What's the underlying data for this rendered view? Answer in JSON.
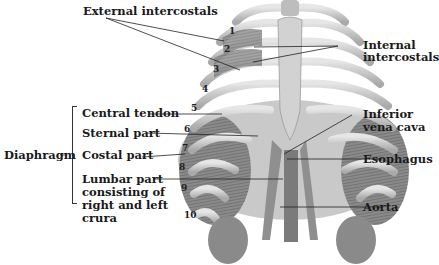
{
  "figure": {
    "labels": {
      "external_intercostals": "External intercostals",
      "internal_intercostals_1": "Internal",
      "internal_intercostals_2": "intercostals",
      "central_tendon": "Central tendon",
      "sternal_part": "Sternal part",
      "costal_part": "Costal part",
      "lumbar_1": "Lumbar part",
      "lumbar_2": "consisting of",
      "lumbar_3": "right and left",
      "lumbar_4": "crura",
      "diaphragm": "Diaphragm",
      "inferior_1": "Inferior",
      "inferior_2": "vena cava",
      "esophagus": "Esophagus",
      "aorta": "Aorta"
    },
    "rib_numbers": [
      "1",
      "2",
      "3",
      "4",
      "5",
      "6",
      "7",
      "8",
      "9",
      "10"
    ]
  }
}
